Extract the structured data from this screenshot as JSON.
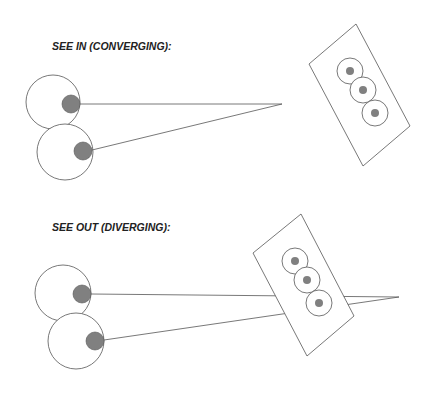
{
  "sections": [
    {
      "title": "SEE IN (CONVERGING):",
      "description": "Two eyes with sight lines converging at a point in front of the card"
    },
    {
      "title": "SEE OUT (DIVERGING):",
      "description": "Two eyes with sight lines crossing behind the card"
    }
  ],
  "colors": {
    "stroke": "#555555",
    "pupil": "#808080",
    "card_fill": "#ffffff",
    "text": "#222222"
  }
}
